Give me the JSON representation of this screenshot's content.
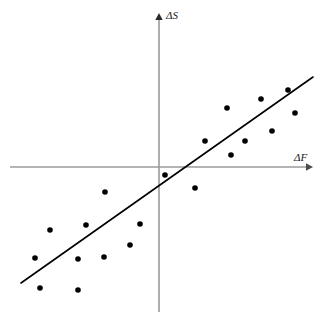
{
  "figure": {
    "title": "",
    "background_color": "#ffffff"
  },
  "axes": {
    "x_axis": {
      "label": "ΔF",
      "color": "#9a9a9a",
      "x_start": 10,
      "x_end": 312,
      "y": 167,
      "arrow": "right"
    },
    "y_axis": {
      "label": "ΔS",
      "color": "#9a9a9a",
      "x": 159,
      "y_start": 312,
      "y_end": 14,
      "arrow": "up"
    },
    "origin": {
      "x": 159,
      "y": 167
    }
  },
  "chart_data": {
    "type": "scatter",
    "title": "",
    "xlabel": "ΔF",
    "ylabel": "ΔS",
    "grid": false,
    "legend": null,
    "axis_style": "quadrant-cross-with-arrows",
    "tick_labels": {
      "x": [],
      "y": []
    },
    "xlim": [
      -149,
      153
    ],
    "ylim": [
      -145,
      153
    ],
    "point_color": "#000000",
    "point_radius": 2.8,
    "points_pixels": [
      {
        "x": 40,
        "y": 288
      },
      {
        "x": 50,
        "y": 230
      },
      {
        "x": 35,
        "y": 258
      },
      {
        "x": 78,
        "y": 290
      },
      {
        "x": 78,
        "y": 259
      },
      {
        "x": 86,
        "y": 225
      },
      {
        "x": 104,
        "y": 257
      },
      {
        "x": 105,
        "y": 192
      },
      {
        "x": 130,
        "y": 245
      },
      {
        "x": 140,
        "y": 224
      },
      {
        "x": 165,
        "y": 175
      },
      {
        "x": 195,
        "y": 188
      },
      {
        "x": 205,
        "y": 141
      },
      {
        "x": 227,
        "y": 108
      },
      {
        "x": 231,
        "y": 155
      },
      {
        "x": 245,
        "y": 141
      },
      {
        "x": 261,
        "y": 99
      },
      {
        "x": 272,
        "y": 131
      },
      {
        "x": 288,
        "y": 90
      },
      {
        "x": 295,
        "y": 113
      }
    ],
    "points_data": [
      {
        "x": -119,
        "y": -121
      },
      {
        "x": -109,
        "y": -63
      },
      {
        "x": -124,
        "y": -91
      },
      {
        "x": -81,
        "y": -123
      },
      {
        "x": -81,
        "y": -92
      },
      {
        "x": -73,
        "y": -58
      },
      {
        "x": -55,
        "y": -90
      },
      {
        "x": -54,
        "y": -25
      },
      {
        "x": -29,
        "y": -78
      },
      {
        "x": -19,
        "y": -57
      },
      {
        "x": 6,
        "y": -8
      },
      {
        "x": 36,
        "y": -21
      },
      {
        "x": 46,
        "y": 26
      },
      {
        "x": 68,
        "y": 59
      },
      {
        "x": 72,
        "y": 12
      },
      {
        "x": 86,
        "y": 26
      },
      {
        "x": 102,
        "y": 68
      },
      {
        "x": 113,
        "y": 36
      },
      {
        "x": 129,
        "y": 77
      },
      {
        "x": 136,
        "y": 54
      }
    ],
    "trend_line": {
      "color": "#000000",
      "width": 1.6,
      "pixels": {
        "x1": 21,
        "y1": 283,
        "x2": 313,
        "y2": 77
      },
      "data": {
        "x1": -138,
        "y1": -116,
        "x2": 154,
        "y2": 90
      },
      "slope": 0.705,
      "intercept": -18.7
    }
  }
}
